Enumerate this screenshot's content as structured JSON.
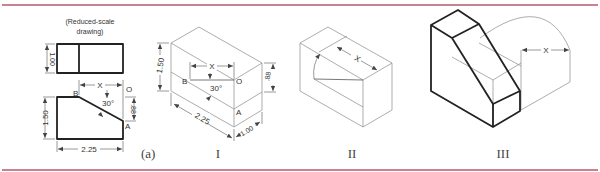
{
  "figure": {
    "rule_color": "#b45a6a",
    "view_a": {
      "note_line1": "(Reduced-scale",
      "note_line2": "drawing)",
      "depth_dim": "1.00",
      "height_dim": "1.50",
      "width_dim": "2.25",
      "offset_dim": ".88",
      "x_dim": "X",
      "angle": "30°",
      "point_b": "B",
      "point_o": "O",
      "point_a": "A",
      "caption": "(a)"
    },
    "step_1": {
      "height_dim": "1.50",
      "width_dim": "2.25",
      "depth_dim": "1.00",
      "offset_dim": ".88",
      "x_dim": "X",
      "angle": "30°",
      "point_b": "B",
      "point_o": "O",
      "point_a": "A",
      "caption": "I"
    },
    "step_2": {
      "x_dim": "X",
      "caption": "II"
    },
    "step_3": {
      "x_dim": "X",
      "caption": "III"
    }
  }
}
